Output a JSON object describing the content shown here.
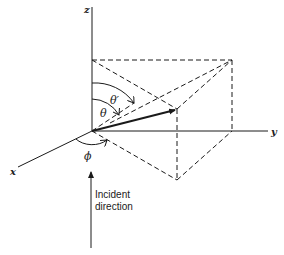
{
  "diagram": {
    "axes": {
      "z": "z",
      "y": "y",
      "x": "x"
    },
    "angles": {
      "theta": "θ",
      "theta_prime": "θ′",
      "phi": "ϕ"
    },
    "incident": {
      "line1": "Incident",
      "line2": "direction"
    },
    "colors": {
      "ink": "#1a1a1a",
      "background": "#ffffff"
    }
  }
}
